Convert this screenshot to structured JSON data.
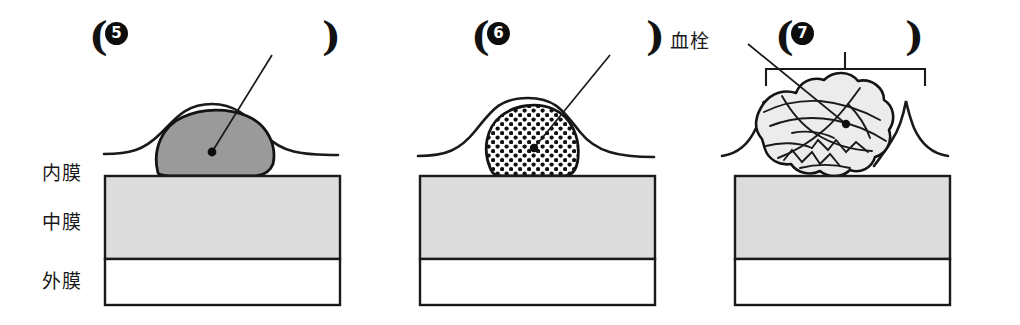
{
  "figure": {
    "title": "",
    "background_color": "#ffffff",
    "ink_color": "#1a1a1a",
    "media_fill": "#dcdcdc",
    "adventitia_fill": "#ffffff",
    "plaque_gray_fill": "#9a9a9a",
    "thrombus_fill": "#ececec"
  },
  "wall_layer_labels": [
    {
      "id": "intima",
      "text": "内膜"
    },
    {
      "id": "media",
      "text": "中膜"
    },
    {
      "id": "adventitia",
      "text": "外膜"
    }
  ],
  "panels": [
    {
      "id": "panel-5",
      "number": "5",
      "open_paren": "(",
      "close_paren": ")",
      "plaque_style": "solid-gray",
      "has_bracket": false,
      "has_leader": true,
      "callout_label": ""
    },
    {
      "id": "panel-6",
      "number": "6",
      "open_paren": "(",
      "close_paren": ")",
      "plaque_style": "dotted-stipple",
      "has_bracket": false,
      "has_leader": true,
      "callout_label": ""
    },
    {
      "id": "panel-7",
      "number": "7",
      "open_paren": "(",
      "close_paren": ")",
      "plaque_style": "ruptured-thrombus",
      "has_bracket": true,
      "has_leader": true,
      "callout_label": "血栓"
    }
  ]
}
